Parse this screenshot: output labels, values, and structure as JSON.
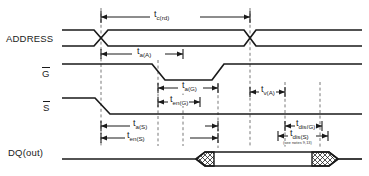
{
  "figure": {
    "type": "timing-diagram",
    "width": 369,
    "height": 176,
    "background": "#ffffff",
    "line_color": "#1a1a1a",
    "dash_color": "#555555"
  },
  "signals": [
    {
      "name": "ADDRESS",
      "label": "ADDRESS",
      "overbar": false,
      "y": 38
    },
    {
      "name": "G",
      "label": "G",
      "overbar": true,
      "y": 72
    },
    {
      "name": "S",
      "label": "S",
      "overbar": true,
      "y": 106
    },
    {
      "name": "DQ",
      "label": "DQ(out)",
      "overbar": false,
      "y": 152
    }
  ],
  "timing_labels": [
    {
      "id": "tc_rd",
      "base": "t",
      "sub": "c(rd)",
      "text": "tc(rd)"
    },
    {
      "id": "ta_A",
      "base": "t",
      "sub": "a(A)",
      "text": "ta(A)"
    },
    {
      "id": "ta_G",
      "base": "t",
      "sub": "a(G)",
      "text": "ta(G)"
    },
    {
      "id": "ten_G",
      "base": "t",
      "sub": "en(G)",
      "text": "ten(G)"
    },
    {
      "id": "ta_S",
      "base": "t",
      "sub": "a(S)",
      "text": "ta(S)"
    },
    {
      "id": "ten_S",
      "base": "t",
      "sub": "en(S)",
      "text": "ten(S)"
    },
    {
      "id": "tv_A",
      "base": "t",
      "sub": "v(A)",
      "text": "tv(A)"
    },
    {
      "id": "tdis_G",
      "base": "t",
      "sub": "dis(G)",
      "text": "tdis(G)"
    },
    {
      "id": "tdis_S",
      "base": "t",
      "sub": "dis(S)",
      "text": "tdis(S)"
    }
  ],
  "annotations": {
    "notes_ref": "(see notes 9,13)"
  }
}
